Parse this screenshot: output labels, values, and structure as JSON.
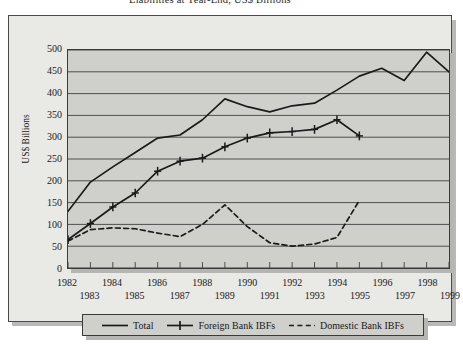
{
  "figure": {
    "title": "Liabilities at Year-End, US$ Billions"
  },
  "chart_data": {
    "type": "line",
    "title": "Liabilities at Year-End, US$ Billions",
    "xlabel": "",
    "ylabel": "US$ Billions",
    "ylim": [
      0,
      500
    ],
    "ytick_step": 50,
    "yticks": [
      0,
      50,
      100,
      150,
      200,
      250,
      300,
      350,
      400,
      450,
      500
    ],
    "ytick_labels": [
      "0",
      "50",
      "100",
      "150",
      "200",
      "250",
      "300",
      "350",
      "400",
      "450",
      "500"
    ],
    "xlim": [
      1982,
      1999
    ],
    "x": [
      1982,
      1983,
      1984,
      1985,
      1986,
      1987,
      1988,
      1989,
      1990,
      1991,
      1992,
      1993,
      1994,
      1995,
      1996,
      1997,
      1998,
      1999
    ],
    "xtick_labels": [
      "1982",
      "1983",
      "1984",
      "1985",
      "1986",
      "1987",
      "1988",
      "1989",
      "1990",
      "1991",
      "1992",
      "1993",
      "1994",
      "1995",
      "1996",
      "1997",
      "1998",
      "1999"
    ],
    "xtick_labels_top": [
      "1982",
      "1984",
      "1986",
      "1988",
      "1990",
      "1992",
      "1994",
      "1996",
      "1998"
    ],
    "xtick_labels_bottom": [
      "1983",
      "1985",
      "1987",
      "1989",
      "1991",
      "1993",
      "1995",
      "1997",
      "1999"
    ],
    "grid": true,
    "grid_axis": "y",
    "legend_position": "below",
    "series": [
      {
        "name": "Total",
        "style": "solid",
        "marker": "none",
        "color": "#1a1a1a",
        "x": [
          1982,
          1983,
          1984,
          1985,
          1986,
          1987,
          1988,
          1989,
          1990,
          1991,
          1992,
          1993,
          1994,
          1995,
          1996,
          1997,
          1998,
          1999
        ],
        "values": [
          130,
          197,
          232,
          265,
          298,
          305,
          340,
          388,
          370,
          358,
          372,
          378,
          408,
          440,
          458,
          430,
          495,
          450
        ]
      },
      {
        "name": "Foreign Bank IBFs",
        "style": "solid",
        "marker": "plus",
        "color": "#1a1a1a",
        "x": [
          1982,
          1983,
          1984,
          1985,
          1986,
          1987,
          1988,
          1989,
          1990,
          1991,
          1992,
          1993,
          1994,
          1995
        ],
        "values": [
          65,
          102,
          140,
          172,
          222,
          245,
          252,
          278,
          298,
          310,
          313,
          318,
          340,
          303
        ]
      },
      {
        "name": "Domestic Bank IBFs",
        "style": "dashed",
        "marker": "none",
        "color": "#1a1a1a",
        "x": [
          1982,
          1983,
          1984,
          1985,
          1986,
          1987,
          1988,
          1989,
          1990,
          1991,
          1992,
          1993,
          1994,
          1995
        ],
        "values": [
          62,
          88,
          92,
          90,
          80,
          72,
          100,
          145,
          95,
          58,
          50,
          55,
          70,
          155
        ]
      }
    ]
  },
  "legend": {
    "items": [
      {
        "label": "Total",
        "style": "solid",
        "marker": "none"
      },
      {
        "label": "Foreign Bank IBFs",
        "style": "solid",
        "marker": "plus"
      },
      {
        "label": "Domestic Bank IBFs",
        "style": "dashed",
        "marker": "none"
      }
    ]
  }
}
